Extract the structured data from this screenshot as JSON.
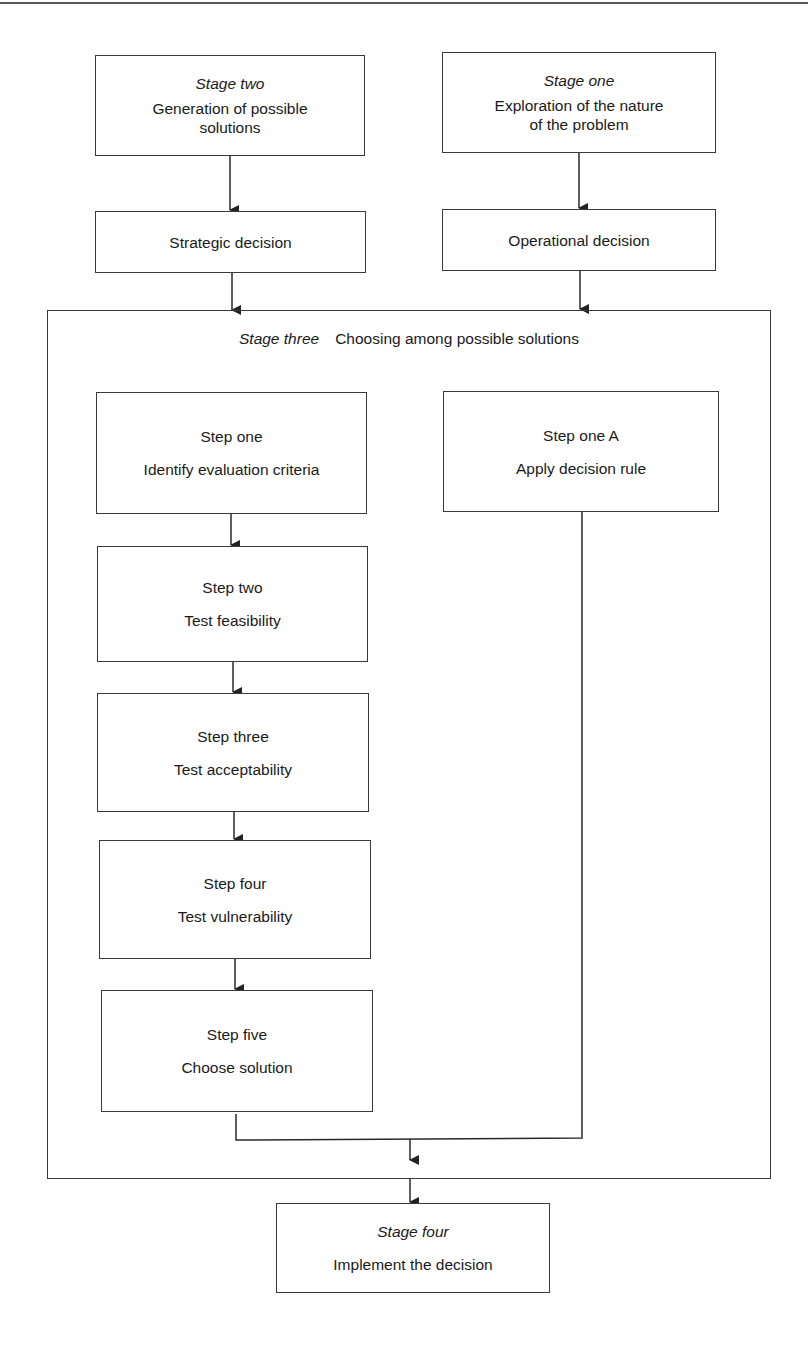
{
  "diagram": {
    "stage_two": {
      "title": "Stage two",
      "text_line1": "Generation of possible",
      "text_line2": "solutions"
    },
    "stage_one": {
      "title": "Stage one",
      "text_line1": "Exploration of the nature",
      "text_line2": "of the problem"
    },
    "strategic": {
      "text": "Strategic decision"
    },
    "operational": {
      "text": "Operational decision"
    },
    "stage_three": {
      "title": "Stage three",
      "text": "Choosing among possible solutions"
    },
    "steps": [
      {
        "title": "Step one",
        "text": "Identify evaluation criteria"
      },
      {
        "title": "Step two",
        "text": "Test feasibility"
      },
      {
        "title": "Step three",
        "text": "Test acceptability"
      },
      {
        "title": "Step four",
        "text": "Test vulnerability"
      },
      {
        "title": "Step five",
        "text": "Choose solution"
      }
    ],
    "step_one_a": {
      "title": "Step one A",
      "text": "Apply decision rule"
    },
    "stage_four": {
      "title": "Stage four",
      "text": "Implement the decision"
    },
    "colors": {
      "line": "#3a3a3a",
      "text": "#1a1a1a",
      "background": "#ffffff"
    }
  }
}
